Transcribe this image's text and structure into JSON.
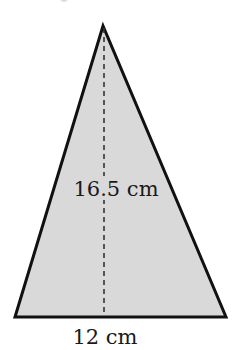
{
  "figure": {
    "shape": "triangle",
    "fill_color": "#d9d9d9",
    "stroke_color": "#111111",
    "dash_color": "#333333",
    "vertices": {
      "apex": [
        103,
        26
      ],
      "bottom_left": [
        15,
        317
      ],
      "bottom_right": [
        226,
        317
      ]
    },
    "altitude": {
      "from": [
        104,
        26
      ],
      "to": [
        104,
        317
      ],
      "style": "dashed"
    }
  },
  "labels": {
    "height": "16.5 cm",
    "base": "12 cm"
  },
  "measurements": {
    "height_value": 16.5,
    "base_value": 12,
    "unit": "cm"
  }
}
